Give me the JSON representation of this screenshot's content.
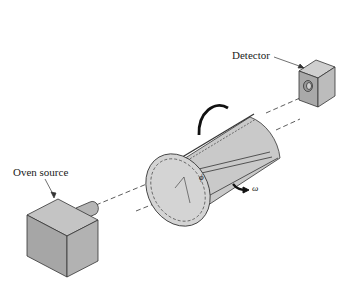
{
  "diagram": {
    "labels": {
      "detector": "Detector",
      "oven_source": "Oven source",
      "angle_symbol": "ϕ",
      "angular_velocity_symbol": "ω"
    },
    "colors": {
      "box_fill_front": "#a8a8a8",
      "box_fill_side": "#bdbdbd",
      "box_fill_top": "#cfcfcf",
      "cylinder_fill": "#c8c8c8",
      "outline": "#333333",
      "background": "#ffffff"
    },
    "components": [
      {
        "name": "oven-source",
        "shape": "cube-with-nozzle"
      },
      {
        "name": "rotating-cylinder",
        "shape": "slotted-cylinder"
      },
      {
        "name": "detector",
        "shape": "cube-with-aperture"
      }
    ]
  }
}
